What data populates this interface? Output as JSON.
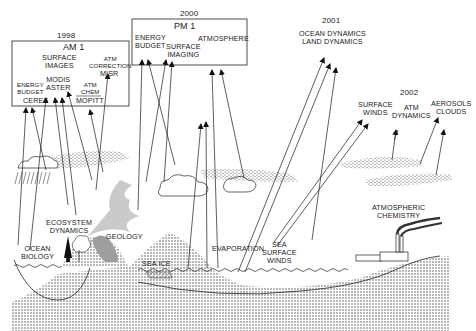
{
  "missions": [
    {
      "year": "1998",
      "platform": "AM 1",
      "instruments": [
        {
          "name": "CERES",
          "measures": [
            "ENERGY",
            "BUDGET"
          ]
        },
        {
          "name": "MODIS ASTER",
          "line1": "MODIS",
          "line2": "ASTER",
          "measures": [
            "SURFACE",
            "IMAGES"
          ]
        },
        {
          "name": "MISR",
          "measures": [
            "ATM",
            "CORRECTION"
          ]
        },
        {
          "name": "MOPITT",
          "measures": [
            "ATM",
            "CHEM"
          ]
        }
      ]
    },
    {
      "year": "2000",
      "platform": "PM 1",
      "measures": [
        {
          "line1": "ENERGY",
          "line2": "BUDGET"
        },
        {
          "line1": "SURFACE",
          "line2": "IMAGING"
        },
        {
          "line1": "ATMOSPHERE"
        }
      ]
    },
    {
      "year": "2001",
      "measures": [
        "OCEAN DYNAMICS",
        "LAND DYNAMICS"
      ]
    },
    {
      "year": "2002",
      "measures": [
        {
          "line1": "SURFACE",
          "line2": "WINDS"
        },
        {
          "line1": "ATM",
          "line2": "DYNAMICS"
        },
        {
          "line1": "AEROSOLS",
          "line2": "CLOUDS"
        }
      ]
    }
  ],
  "surface_labels": {
    "ocean_biology": [
      "OCEAN",
      "BIOLOGY"
    ],
    "ecosystem_dynamics": [
      "ECOSYSTEM",
      "DYNAMICS"
    ],
    "geology": "GEOLOGY",
    "sea_ice": "SEA ICE",
    "evaporation": "EVAPORATION",
    "sea_surface_winds": [
      "SEA",
      "SURFACE",
      "WINDS"
    ],
    "atmospheric_chemistry": [
      "ATMOSPHERIC",
      "CHEMISTRY"
    ]
  },
  "colors": {
    "ink": "#1a1a1a",
    "background": "#ffffff"
  }
}
